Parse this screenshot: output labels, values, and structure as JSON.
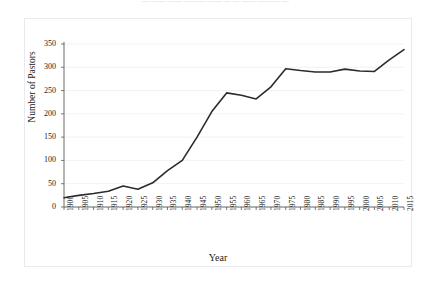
{
  "document": {
    "clipped_title": "— —— —— ——— —— — — —— ——— —"
  },
  "chart_data": {
    "type": "line",
    "title": "",
    "xlabel": "Year",
    "ylabel": "Number of Pastors",
    "x": [
      1900,
      1905,
      1910,
      1915,
      1920,
      1925,
      1930,
      1935,
      1940,
      1945,
      1950,
      1955,
      1960,
      1965,
      1970,
      1975,
      1980,
      1985,
      1990,
      1995,
      2000,
      2005,
      2010,
      2015
    ],
    "categories": [
      "1900",
      "1905",
      "1910",
      "1915",
      "1920",
      "1925",
      "1930",
      "1935",
      "1940",
      "1945",
      "1950",
      "1955",
      "1960",
      "1965",
      "1970",
      "1975",
      "1980",
      "1985",
      "1990",
      "1995",
      "2000",
      "2005",
      "2010",
      "2015"
    ],
    "values": [
      20,
      25,
      29,
      34,
      45,
      38,
      52,
      78,
      100,
      150,
      205,
      245,
      240,
      232,
      258,
      297,
      293,
      290,
      290,
      296,
      292,
      291,
      316,
      338
    ],
    "series": [
      {
        "name": "Number of Pastors",
        "color": "#2b2b2b",
        "values": [
          20,
          25,
          29,
          34,
          45,
          38,
          52,
          78,
          100,
          150,
          205,
          245,
          240,
          232,
          258,
          297,
          293,
          290,
          290,
          296,
          292,
          291,
          316,
          338
        ]
      }
    ],
    "yticks": [
      0,
      50,
      100,
      150,
      200,
      250,
      300,
      350
    ],
    "ytick_labels": [
      "0",
      "50",
      "100",
      "150",
      "200",
      "250",
      "300",
      "350"
    ],
    "ylim": [
      0,
      350
    ],
    "xlim": [
      1900,
      2015
    ],
    "grid": true,
    "grid_color": "#f2f2f5",
    "legend": false,
    "legend_position": "none",
    "line_width": 1.6,
    "markers": false,
    "axis_color": "#595959",
    "xtick_rotation": -90
  }
}
